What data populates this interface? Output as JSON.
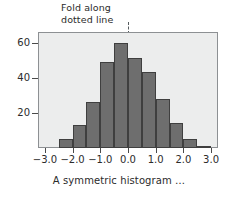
{
  "annotation": {
    "text": "Fold along\ndotted line",
    "line_style": "dotted"
  },
  "caption": "A symmetric histogram …",
  "colors": {
    "bar_fill": "#6e6e6e",
    "bar_edge": "#3f3f3f",
    "plot_background": "#eceded",
    "frame": "#8d9093",
    "text": "#2b2b2b",
    "fold_line": "#555b5e"
  },
  "chart_data": {
    "type": "bar",
    "title": "",
    "subtitle": "",
    "xlabel": "A symmetric histogram …",
    "ylabel": "",
    "xlim": [
      -3.25,
      3.25
    ],
    "ylim": [
      0,
      66
    ],
    "grid": false,
    "legend": null,
    "bin_width": 0.5,
    "categories": [
      "-2.5",
      "-2.0",
      "-1.5",
      "-1.0",
      "-0.5",
      "0.0",
      "0.5",
      "1.0",
      "1.5",
      "2.0",
      "2.5"
    ],
    "bin_edges": [
      -2.5,
      -2.0,
      -1.5,
      -1.0,
      -0.5,
      0.0,
      0.5,
      1.0,
      1.5,
      2.0,
      2.5,
      3.0
    ],
    "values": [
      5,
      13,
      26,
      49,
      60,
      51,
      43,
      28,
      14,
      5,
      1
    ],
    "xticks": [
      -3.0,
      -2.0,
      -1.0,
      0.0,
      1.0,
      2.0,
      3.0
    ],
    "xticklabels": [
      "-3.0",
      "-2.0",
      "-1.0",
      "0.0",
      "1.0",
      "2.0",
      "3.0"
    ],
    "yticks": [
      20,
      40,
      60
    ],
    "yticklabels": [
      "20",
      "40",
      "60"
    ],
    "annotations": [
      {
        "text": "Fold along dotted line",
        "x": 0.0,
        "type": "dotted-vertical-marker"
      }
    ]
  }
}
